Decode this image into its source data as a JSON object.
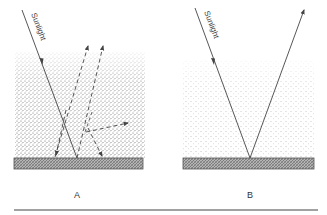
{
  "panels": [
    {
      "id": "A",
      "label": "A",
      "incoming_label": "Sunlight",
      "description": "Sunlight enters a hazy/particle-laden layer and is scattered in multiple directions (dashed arrows)"
    },
    {
      "id": "B",
      "label": "B",
      "incoming_label": "Sunlight",
      "description": "Sunlight passes through a clearer layer and reflects directly off the surface"
    }
  ],
  "colors": {
    "line": "#444444",
    "surface_fill": "#8a8a8a",
    "dots_dense": "#555555",
    "dots_sparse": "#888888",
    "rule": "#444444"
  }
}
